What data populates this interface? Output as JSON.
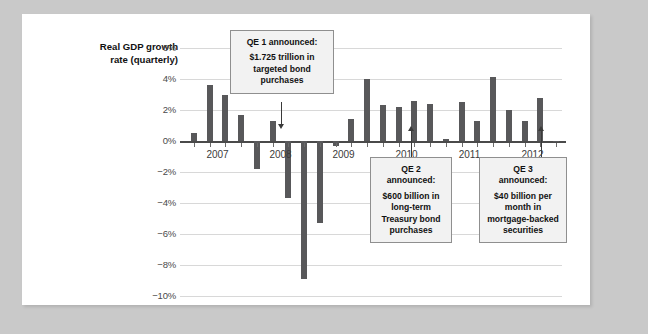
{
  "chart_data": {
    "type": "bar",
    "title": "",
    "ylabel": "Real GDP growth rate (quarterly)",
    "xlabel": "",
    "ylim": [
      -10,
      6
    ],
    "grid": true,
    "legend": "none",
    "ytick_labels": [
      "6%",
      "4%",
      "2%",
      "0%",
      "-2%",
      "-4%",
      "-6%",
      "-8%",
      "-10%"
    ],
    "ytick_values": [
      6,
      4,
      2,
      0,
      -2,
      -4,
      -6,
      -8,
      -10
    ],
    "xtick_labels": [
      "2007",
      "2008",
      "2009",
      "2010",
      "2011",
      "2012"
    ],
    "categories": [
      "2007 Q1",
      "2007 Q2",
      "2007 Q3",
      "2007 Q4",
      "2008 Q1",
      "2008 Q2",
      "2008 Q3",
      "2008 Q4",
      "2009 Q1",
      "2009 Q2",
      "2009 Q3",
      "2009 Q4",
      "2010 Q1",
      "2010 Q2",
      "2010 Q3",
      "2010 Q4",
      "2011 Q1",
      "2011 Q2",
      "2011 Q3",
      "2011 Q4",
      "2012 Q1",
      "2012 Q2",
      "2012 Q3",
      "2012 Q4"
    ],
    "values": [
      0.5,
      3.6,
      3.0,
      1.7,
      -1.8,
      1.3,
      -3.7,
      -8.9,
      -5.3,
      -0.3,
      1.4,
      4.0,
      2.3,
      2.2,
      2.6,
      2.4,
      0.1,
      2.5,
      1.3,
      4.1,
      2.0,
      1.3,
      2.8,
      0.0
    ],
    "bar_color": "#58585a"
  },
  "annotations": [
    {
      "id": "qe1",
      "heading": "QE 1 announced:",
      "body_lines": [
        "$1.725 trillion in",
        "targeted bond",
        "purchases"
      ],
      "points_to": "2008 Q4",
      "arrow": "down"
    },
    {
      "id": "qe2",
      "heading_lines": [
        "QE 2",
        "announced:"
      ],
      "body_lines": [
        "$600 billion in",
        "long-term",
        "Treasury bond",
        "purchases"
      ],
      "points_to": "2010 Q4",
      "arrow": "up"
    },
    {
      "id": "qe3",
      "heading_lines": [
        "QE 3",
        "announced:"
      ],
      "body_lines": [
        "$40 billion per",
        "month in",
        "mortgage-backed",
        "securities"
      ],
      "points_to": "2012 Q3",
      "arrow": "up"
    }
  ],
  "colors": {
    "page_background": "#c9c9c9",
    "card_background": "#ffffff",
    "bar": "#58585a",
    "gridline": "#d8d8d8",
    "axis": "#4a4a4a",
    "callout_fill": "#f2f2f2",
    "callout_border": "#8f8f8f"
  }
}
